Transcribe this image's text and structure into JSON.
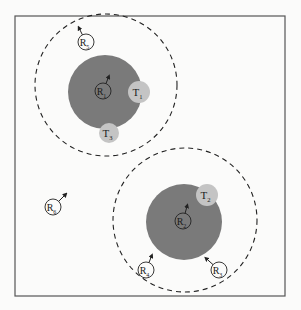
{
  "diagram": {
    "frame": {
      "x": 15,
      "y": 16,
      "width": 270,
      "height": 280,
      "stroke": "#555555"
    },
    "colors": {
      "coverage_fill": "#7a7a7a",
      "target_fill": "#c4c4c4",
      "node_stroke": "#222222",
      "dashed_stroke": "#222222",
      "background": "#fbfbfa"
    },
    "range_circles": [
      {
        "id": "range-1",
        "cx": 106,
        "cy": 85,
        "r": 71
      },
      {
        "id": "range-2",
        "cx": 185,
        "cy": 220,
        "r": 72
      }
    ],
    "coverage_disks": [
      {
        "id": "coverage-1",
        "cx": 105,
        "cy": 92,
        "r": 37
      },
      {
        "id": "coverage-2",
        "cx": 184,
        "cy": 222,
        "r": 38
      }
    ],
    "targets": [
      {
        "id": "T1",
        "base": "T",
        "sub": "1",
        "cx": 139,
        "cy": 92,
        "r": 11
      },
      {
        "id": "T2",
        "base": "T",
        "sub": "2",
        "cx": 207,
        "cy": 195,
        "r": 11
      },
      {
        "id": "T3",
        "base": "T",
        "sub": "3",
        "cx": 109,
        "cy": 133,
        "r": 10
      }
    ],
    "robots": [
      {
        "id": "R1",
        "base": "R",
        "sub": "1",
        "cx": 103,
        "cy": 91,
        "r": 8,
        "arrow": {
          "dx": 4,
          "dy": -10
        }
      },
      {
        "id": "R2",
        "base": "R",
        "sub": "2",
        "cx": 183,
        "cy": 221,
        "r": 8,
        "arrow": {
          "dx": 3,
          "dy": -11
        }
      },
      {
        "id": "R3",
        "base": "R",
        "sub": "3",
        "cx": 219,
        "cy": 270,
        "r": 8,
        "arrow": {
          "dx": -10,
          "dy": -9
        }
      },
      {
        "id": "R4",
        "base": "R",
        "sub": "4",
        "cx": 146,
        "cy": 270,
        "r": 8,
        "arrow": {
          "dx": 4,
          "dy": -10
        }
      },
      {
        "id": "R5",
        "base": "R",
        "sub": "5",
        "cx": 86,
        "cy": 42,
        "r": 8,
        "arrow": {
          "dx": -5,
          "dy": -10
        }
      },
      {
        "id": "R6",
        "base": "R",
        "sub": "6",
        "cx": 53,
        "cy": 207,
        "r": 8,
        "arrow": {
          "dx": 10,
          "dy": -10
        }
      }
    ]
  }
}
